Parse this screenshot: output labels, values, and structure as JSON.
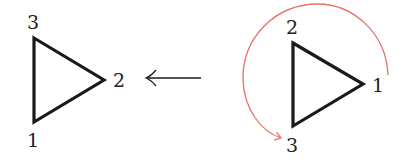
{
  "diagram": {
    "type": "triangle-rotation",
    "colors": {
      "stroke": "#1a1a1a",
      "rotation_arc": "#e8706a",
      "label": "#222222"
    },
    "left_triangle": {
      "labels": {
        "top": "3",
        "right": "2",
        "bottom": "1"
      }
    },
    "arrow": {
      "direction": "left",
      "glyph": "long-left-arrow-icon"
    },
    "right_triangle": {
      "labels": {
        "top": "2",
        "right": "1",
        "bottom": "3"
      },
      "rotation": {
        "direction": "counterclockwise",
        "from_label": "1",
        "to_label": "3"
      }
    }
  }
}
